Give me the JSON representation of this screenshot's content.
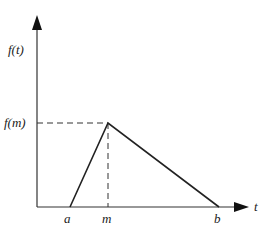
{
  "diagram": {
    "type": "triangular distribution",
    "y_axis_label": "f(t)",
    "x_axis_label": "t",
    "peak_label": "f(m)",
    "x_ticks": [
      {
        "label": "a"
      },
      {
        "label": "m"
      },
      {
        "label": "b"
      }
    ],
    "colors": {
      "line": "#222222",
      "background": "#ffffff"
    }
  }
}
